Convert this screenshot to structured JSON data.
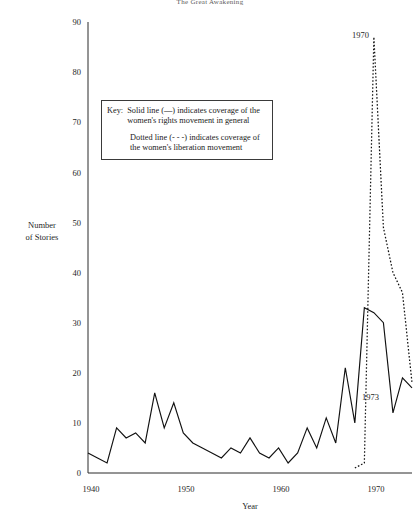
{
  "figure": {
    "title": "The Great Awakening"
  },
  "key": {
    "label": "Key:",
    "entry_solid": "Solid line (—) indicates coverage of the women's rights movement in general",
    "entry_dotted": "Dotted line (- - -) indicates coverage of the women's liberation movement"
  },
  "annotations": [
    {
      "name": "peak-1970-label",
      "text": "1970",
      "x": 352,
      "y": 38
    },
    {
      "name": "trough-1973-label",
      "text": "1973",
      "x": 362,
      "y": 400
    }
  ],
  "chart_data": {
    "type": "line",
    "title": "The Great Awakening",
    "xlabel": "Year",
    "ylabel": "Number of Stories",
    "xlim": [
      1940,
      1974
    ],
    "ylim": [
      0,
      90
    ],
    "xticks": [
      1940,
      1950,
      1960,
      1970
    ],
    "yticks": [
      0,
      10,
      20,
      30,
      40,
      50,
      60,
      70,
      80,
      90
    ],
    "grid": false,
    "legend": "inset key box",
    "series": [
      {
        "name": "Women's rights movement (general)",
        "style": "solid",
        "x": [
          1940,
          1941,
          1942,
          1943,
          1944,
          1945,
          1946,
          1947,
          1948,
          1949,
          1950,
          1951,
          1952,
          1953,
          1954,
          1955,
          1956,
          1957,
          1958,
          1959,
          1960,
          1961,
          1962,
          1963,
          1964,
          1965,
          1966,
          1967,
          1968,
          1969,
          1970,
          1971,
          1972,
          1973,
          1974
        ],
        "values": [
          4,
          3,
          2,
          9,
          7,
          8,
          6,
          16,
          9,
          14,
          8,
          6,
          5,
          4,
          3,
          5,
          4,
          7,
          4,
          3,
          5,
          2,
          4,
          9,
          5,
          11,
          6,
          21,
          10,
          33,
          32,
          30,
          12,
          19,
          17
        ]
      },
      {
        "name": "Women's liberation movement",
        "style": "dotted",
        "x": [
          1968,
          1969,
          1970,
          1971,
          1972,
          1973,
          1974
        ],
        "values": [
          1,
          2,
          87,
          49,
          40,
          36,
          18
        ]
      }
    ]
  },
  "geometry": {
    "plot_left": 88,
    "plot_right": 412,
    "plot_bottom": 473,
    "plot_top": 22,
    "x_min": 1940,
    "x_max": 1974,
    "y_min": 0,
    "y_max": 90
  }
}
